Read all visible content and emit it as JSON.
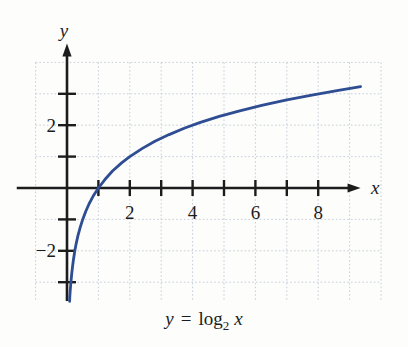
{
  "page": {
    "background": "#fdfdfc"
  },
  "caption": {
    "var_y": "y",
    "equals": "=",
    "func": "log",
    "base": "2",
    "arg": "x"
  },
  "chart_data": {
    "type": "line",
    "xlabel": "x",
    "ylabel": "y",
    "xlim": [
      -1.6,
      9.35
    ],
    "ylim": [
      -3.6,
      4.6
    ],
    "x_ticks": [
      1,
      2,
      3,
      4,
      5,
      6,
      7,
      8
    ],
    "y_ticks": [
      -3,
      -2,
      -1,
      1,
      2,
      3
    ],
    "x_tick_labels": [
      {
        "value": 2,
        "label": "2"
      },
      {
        "value": 4,
        "label": "4"
      },
      {
        "value": 6,
        "label": "6"
      },
      {
        "value": 8,
        "label": "8"
      }
    ],
    "y_tick_labels": [
      {
        "value": 2,
        "label": "2"
      },
      {
        "value": -2,
        "label": "−2"
      }
    ],
    "grid": {
      "on": true,
      "vertical_at": [
        -1,
        1,
        2,
        3,
        4,
        5,
        6,
        7,
        8,
        9,
        10
      ],
      "horizontal_at": [
        4,
        3,
        2,
        1,
        -1,
        -2,
        -3
      ],
      "x_left": -1,
      "x_right": 10,
      "y_top": 4,
      "y_bottom": -3.6
    },
    "series": [
      {
        "name": "y = log2(x)",
        "color": "#2e4d92",
        "points": [
          [
            0.082,
            -3.61
          ],
          [
            0.09,
            -3.47
          ],
          [
            0.1,
            -3.32
          ],
          [
            0.115,
            -3.12
          ],
          [
            0.13,
            -2.94
          ],
          [
            0.15,
            -2.74
          ],
          [
            0.175,
            -2.51
          ],
          [
            0.2,
            -2.32
          ],
          [
            0.25,
            -2.0
          ],
          [
            0.3,
            -1.74
          ],
          [
            0.35,
            -1.51
          ],
          [
            0.42,
            -1.25
          ],
          [
            0.5,
            -1.0
          ],
          [
            0.6,
            -0.74
          ],
          [
            0.7,
            -0.51
          ],
          [
            0.85,
            -0.23
          ],
          [
            1.0,
            0.0
          ],
          [
            1.2,
            0.26
          ],
          [
            1.45,
            0.54
          ],
          [
            1.75,
            0.81
          ],
          [
            2.0,
            1.0
          ],
          [
            2.4,
            1.26
          ],
          [
            2.8,
            1.49
          ],
          [
            3.25,
            1.7
          ],
          [
            3.75,
            1.91
          ],
          [
            4.25,
            2.09
          ],
          [
            4.85,
            2.28
          ],
          [
            5.5,
            2.46
          ],
          [
            6.2,
            2.63
          ],
          [
            7.0,
            2.81
          ],
          [
            7.8,
            2.96
          ],
          [
            8.6,
            3.1
          ],
          [
            9.35,
            3.23
          ]
        ]
      }
    ],
    "colors": {
      "axis": "#1c1c1c",
      "grid": "#b9c4d1",
      "text": "#1c1c1c"
    },
    "layout": {
      "origin_px": [
        67,
        188
      ],
      "unit_px": 31.4,
      "legend": "none"
    }
  }
}
